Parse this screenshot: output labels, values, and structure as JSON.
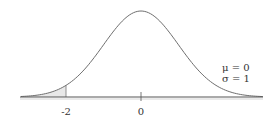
{
  "chart_data": {
    "type": "area",
    "title": "",
    "xlabel": "",
    "ylabel": "",
    "distribution": {
      "mu": 0,
      "sigma": 1
    },
    "xlim": [
      -3.2,
      3.25
    ],
    "tick_labels": [
      "-2",
      "0"
    ],
    "ticks": [
      -2,
      0
    ],
    "shaded_region": {
      "from": -3.2,
      "to": -2
    },
    "annotation": {
      "mu_label": "μ = 0",
      "sigma_label": "σ = 1"
    },
    "grid": false
  },
  "colors": {
    "curve": "#6e6e6e",
    "shade": "#e6e6e6",
    "axis": "#555555"
  }
}
